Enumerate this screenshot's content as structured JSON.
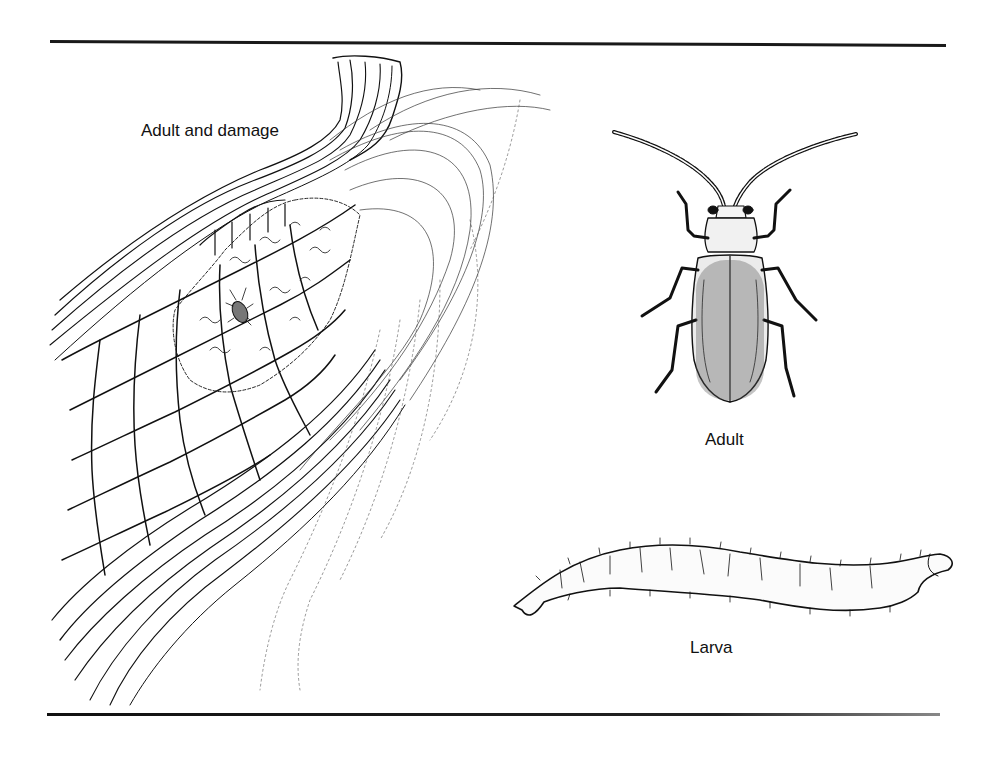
{
  "figure": {
    "panels": [
      {
        "id": "adult-and-damage",
        "label": "Adult and damage",
        "depicts": "corn ear with husk and silk, feeding damage on kernels, small adult beetle"
      },
      {
        "id": "adult",
        "label": "Adult",
        "depicts": "dorsal view of adult beetle with long segmented antennae"
      },
      {
        "id": "larva",
        "label": "Larva",
        "depicts": "lateral view of slender larva with bristles"
      }
    ],
    "colors": {
      "ink": "#111111",
      "background": "#ffffff",
      "rule": "#1a1a1a"
    }
  }
}
